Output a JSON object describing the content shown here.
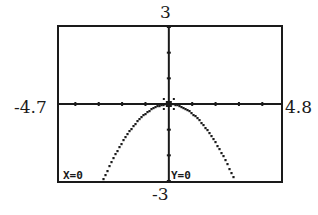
{
  "window": {
    "xmin": "-4.7",
    "xmax": "4.8",
    "ymin": "-3",
    "ymax": "3"
  },
  "readout": {
    "x": "X=0",
    "y": "Y=0"
  },
  "colors": {
    "ink": "#1a1a1a",
    "screen": "#ffffff"
  },
  "chart_data": {
    "type": "line",
    "title": "",
    "xlabel": "",
    "ylabel": "",
    "xlim": [
      -4.7,
      4.8
    ],
    "ylim": [
      -3,
      3
    ],
    "grid": false,
    "x_tick_spacing": 1,
    "y_tick_spacing": 1,
    "range_labels": {
      "left": "-4.7",
      "right": "4.8",
      "top": "3",
      "bottom": "-3"
    },
    "cursor": {
      "x": 0,
      "y": 0,
      "readout": [
        "X=0",
        "Y=0"
      ]
    },
    "series": [
      {
        "name": "downward parabola (approx. y = -0.375x^2)",
        "x": [
          -2.8,
          -2.5,
          -2.0,
          -1.5,
          -1.0,
          -0.5,
          0,
          0.5,
          1.0,
          1.5,
          2.0,
          2.5,
          2.8
        ],
        "y": [
          -2.94,
          -2.34,
          -1.5,
          -0.84,
          -0.38,
          -0.09,
          0,
          -0.09,
          -0.38,
          -0.84,
          -1.5,
          -2.34,
          -2.94
        ]
      }
    ]
  }
}
